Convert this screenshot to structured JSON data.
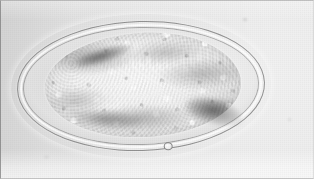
{
  "image": {
    "kind": "light-microscopy-photomicrograph",
    "subject": "parasite ovum (trematode egg)",
    "width_px": 314,
    "height_px": 179,
    "color_mode": "grayscale",
    "background_color": "#dcdcdc",
    "field_highlight_color": "#ededed",
    "field_shadow_color": "#d2d2d2",
    "border_color": "#8c8c8c"
  },
  "specimen": {
    "label": "ovum",
    "shape": "ellipse (ovoid)",
    "orientation": "horizontal, tilted about -1.6 degrees",
    "bounding_box": {
      "x": 17,
      "y": 21,
      "width": 248,
      "height": 130
    },
    "shell": {
      "label": "egg shell",
      "outer_line_color": "#828282",
      "refractile_halo_color": "#ffffff",
      "inner_line_color": "#919191",
      "wall_thickness_px": 6
    },
    "perivitelline_space": {
      "label": "perivitelline space",
      "description": "clear gap between shell and inner cell mass",
      "color": "#e4e4e4"
    },
    "contents": {
      "label": "morula / granular yolk mass",
      "bounding_box": {
        "x": 45,
        "y": 33,
        "width": 196,
        "height": 104
      },
      "texture": "dense coarse granules",
      "highlight_color": "#fbfbfb",
      "granule_shadow_color": "#787878",
      "mottling_color": "#555555"
    },
    "features": [
      {
        "name": "dark-crescent-upper-left",
        "x": 59,
        "y": 43,
        "w": 86,
        "h": 20
      },
      {
        "name": "dark-shading-lower-right",
        "x": 177,
        "y": 99,
        "w": 78,
        "h": 34
      },
      {
        "name": "dark-shading-lower-left",
        "x": 55,
        "y": 107,
        "w": 96,
        "h": 24
      },
      {
        "name": "refractile-bubble",
        "x": 162,
        "y": 143,
        "w": 9,
        "h": 8
      }
    ]
  },
  "artifacts": [
    {
      "name": "dust-speck-top-right",
      "x": 243,
      "y": 18
    },
    {
      "name": "dust-speck-bottom-left",
      "x": 44,
      "y": 156
    },
    {
      "name": "dust-speck-right",
      "x": 288,
      "y": 118
    }
  ]
}
